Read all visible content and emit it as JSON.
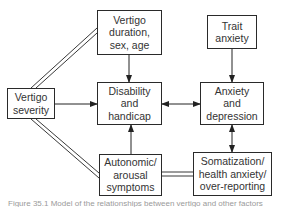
{
  "nodes": {
    "vertigo_duration": {
      "label": "Vertigo\nduration,\nsex, age"
    },
    "trait_anxiety": {
      "label": "Trait\nanxiety"
    },
    "vertigo_severity": {
      "label": "Vertigo\nseverity"
    },
    "disability": {
      "label": "Disability\nand\nhandicap"
    },
    "anxiety_depression": {
      "label": "Anxiety\nand\ndepression"
    },
    "autonomic": {
      "label": "Autonomic/\narousal\nsymptoms"
    },
    "somatization": {
      "label": "Somatization/\nhealth anxiety/\nover-reporting"
    }
  },
  "edges": [
    {
      "from": "vertigo_duration",
      "to": "disability",
      "type": "arrow"
    },
    {
      "from": "trait_anxiety",
      "to": "anxiety_depression",
      "type": "arrow"
    },
    {
      "from": "vertigo_severity",
      "to": "disability",
      "type": "arrow"
    },
    {
      "from": "autonomic",
      "to": "disability",
      "type": "arrow"
    },
    {
      "from": "disability",
      "to": "anxiety_depression",
      "type": "bidirectional"
    },
    {
      "from": "anxiety_depression",
      "to": "somatization",
      "type": "bidirectional"
    },
    {
      "from": "vertigo_severity",
      "to": "vertigo_duration",
      "type": "association"
    },
    {
      "from": "vertigo_severity",
      "to": "autonomic",
      "type": "association"
    },
    {
      "from": "autonomic",
      "to": "somatization",
      "type": "association"
    }
  ],
  "caption": "Figure 35.1 Model of the relationships between vertigo and other factors"
}
